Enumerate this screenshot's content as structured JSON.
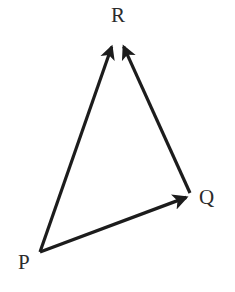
{
  "figure": {
    "width": 235,
    "height": 292,
    "background_color": "#ffffff",
    "stroke_color": "#1c1c1c",
    "label_color": "#2b2b2b",
    "stroke_width": 3.2
  },
  "labels": {
    "p": "P",
    "q": "Q",
    "r": "R"
  },
  "chart_data": {
    "type": "diagram",
    "subtype": "vector-triangle",
    "points": [
      {
        "name": "P",
        "x": 40,
        "y": 252,
        "label": "P",
        "label_x": 25,
        "label_y": 268
      },
      {
        "name": "Q",
        "x": 190,
        "y": 195,
        "label": "Q",
        "label_x": 206,
        "label_y": 203
      },
      {
        "name": "R",
        "x": 118,
        "y": 40,
        "label": "R",
        "label_x": 118,
        "label_y": 21
      }
    ],
    "vectors": [
      {
        "name": "PR",
        "from": "P",
        "to": "R",
        "arrowhead": "to",
        "x1": 40,
        "y1": 252,
        "x2": 113,
        "y2": 43
      },
      {
        "name": "PQ",
        "from": "P",
        "to": "Q",
        "arrowhead": "to",
        "x1": 40,
        "y1": 252,
        "x2": 190,
        "y2": 196
      },
      {
        "name": "QR",
        "from": "Q",
        "to": "R",
        "arrowhead": "to",
        "x1": 190,
        "y1": 193,
        "x2": 122,
        "y2": 43
      }
    ],
    "grid": false,
    "legend": false,
    "axes": false
  }
}
